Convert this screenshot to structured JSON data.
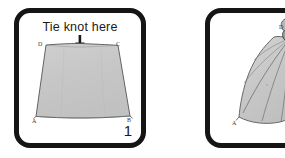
{
  "figure": {
    "background_color": "#ffffff",
    "panel_border_color": "#151515",
    "cloth_fill_color": "#c9c9c9",
    "cloth_outline_color": "#4a4a4a"
  },
  "panels": [
    {
      "number": "1",
      "caption": "Tie knot here",
      "arrow": "down-arrow",
      "shape": "trapezoid-cloth",
      "corner_labels": {
        "top_left": "D",
        "top_right": "C",
        "bottom_left": "A",
        "bottom_right": "B"
      }
    },
    {
      "number": "",
      "caption": "",
      "arrow": "",
      "shape": "knotted-cloth",
      "corner_labels": {
        "top": "D",
        "bottom_left": "A"
      }
    }
  ]
}
